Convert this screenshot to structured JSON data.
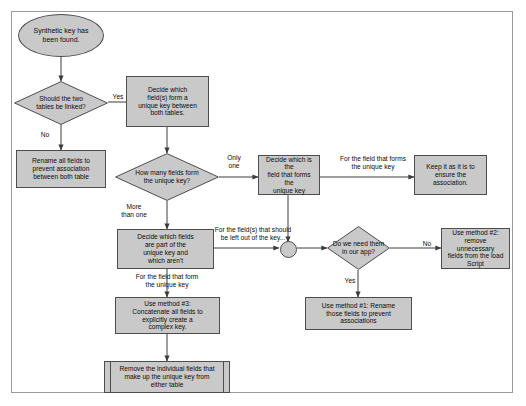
{
  "diagram": {
    "colors": {
      "node_fill": "#c9c9c9",
      "node_stroke": "#4d4d4d",
      "line": "#3c3c3c",
      "frame": "#9a9a9a",
      "background": "#ffffff",
      "text": "#0b0b0b"
    }
  },
  "nodes": {
    "start": {
      "label": "Synthetic key has\nbeen found.",
      "shape": "terminator"
    },
    "should_link": {
      "label": "Should the two\ntables be linked?",
      "shape": "decision"
    },
    "rename_all": {
      "label": "Rename all fields to\nprevent association\nbetween both table",
      "shape": "process"
    },
    "decide_fields": {
      "label": "Decide which\nfield(s) form a\nunique key between\nboth tables.",
      "shape": "process"
    },
    "how_many": {
      "label": "How many fields form\nthe unique key?",
      "shape": "decision"
    },
    "decide_which_is": {
      "label": "Decide which is the\nfield that forms the\nunique key",
      "shape": "process"
    },
    "keep_as_is": {
      "label": "Keep it as it is to\nensure the\nassociation.",
      "shape": "process"
    },
    "decide_part_of": {
      "label": "Decide which fields\nare part of the\nunique key and\nwhich aren't",
      "shape": "process"
    },
    "junction": {
      "label": "",
      "shape": "junction"
    },
    "need_them": {
      "label": "Do we need them\nin our app?",
      "shape": "decision"
    },
    "method2": {
      "label": "Use method #2:\nremove unnecessary\nfields from the load\nScript",
      "shape": "process"
    },
    "method1": {
      "label": "Use method #1: Rename\nthose fields to prevent\nassociations",
      "shape": "process"
    },
    "method3": {
      "label": "Use method #3:\nConcatenate all fields to\nexplicitly create a\ncomplex key.",
      "shape": "process"
    },
    "remove_individual": {
      "label": "Remove the individual fields that\nmake up the unique key from\neither table",
      "shape": "predefined-process"
    }
  },
  "edge_labels": {
    "yes_link": "Yes",
    "no_link": "No",
    "only_one": "Only\none",
    "more_than_one": "More\nthan one",
    "for_field_forms_unique_key_top": "For the field that forms\nthe unique key",
    "for_fields_left_out": "For the field(s) that should\nbe left out of the key...",
    "for_field_that_form": "For the field that form\nthe unique key",
    "no_need": "No",
    "yes_need": "Yes"
  }
}
